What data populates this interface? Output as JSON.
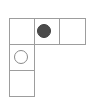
{
  "figure": {
    "type": "grid-puzzle",
    "background_color": "#ffffff",
    "grid_line_color": "#9d9d9d",
    "canvas": {
      "width": 94,
      "height": 105
    }
  },
  "grid": {
    "columns": 3,
    "rows": 3,
    "cell_width": 25,
    "cell_height": 26,
    "origin_x": 9,
    "origin_y": 18,
    "shape": "L",
    "cells": [
      {
        "id": "cell-r0c0",
        "row": 0,
        "col": 0,
        "x": 9,
        "y": 18,
        "width": 26,
        "height": 27,
        "content": "empty"
      },
      {
        "id": "cell-r0c1",
        "row": 0,
        "col": 1,
        "x": 34,
        "y": 18,
        "width": 26,
        "height": 27,
        "content": "filled-circle"
      },
      {
        "id": "cell-r0c2",
        "row": 0,
        "col": 2,
        "x": 59,
        "y": 18,
        "width": 27,
        "height": 27,
        "content": "empty"
      },
      {
        "id": "cell-r1c0",
        "row": 1,
        "col": 0,
        "x": 9,
        "y": 44,
        "width": 26,
        "height": 27,
        "content": "hollow-circle"
      },
      {
        "id": "cell-r2c0",
        "row": 2,
        "col": 0,
        "x": 9,
        "y": 70,
        "width": 26,
        "height": 27,
        "content": "empty"
      }
    ]
  },
  "tokens": [
    {
      "id": "token-filled",
      "kind": "filled-circle",
      "cell": "cell-r0c1",
      "center_x": 44,
      "center_y": 31,
      "radius": 7,
      "fill_color": "#4b4b4b",
      "stroke_color": "#3f3f3f"
    },
    {
      "id": "token-hollow",
      "kind": "hollow-circle",
      "cell": "cell-r1c0",
      "center_x": 21,
      "center_y": 57,
      "radius": 7,
      "fill_color": "none",
      "stroke_color": "#8a8a8a"
    }
  ]
}
